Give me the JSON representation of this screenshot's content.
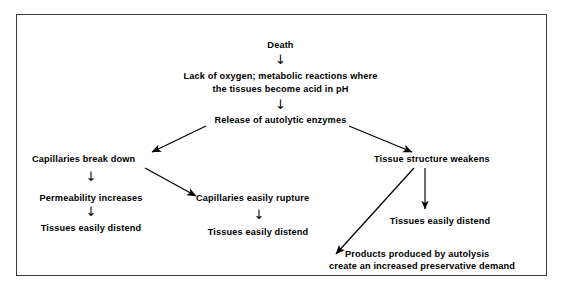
{
  "diagram": {
    "title_absent": true,
    "border_color": "#3a3a3a",
    "text_color": "#000000",
    "background": "#ffffff",
    "nodes": [
      {
        "id": "death",
        "label": "Death"
      },
      {
        "id": "lack_oxygen_l1",
        "label": "Lack of oxygen; metabolic reactions where"
      },
      {
        "id": "lack_oxygen_l2",
        "label": "the tissues become acid in pH"
      },
      {
        "id": "release_enzymes",
        "label": "Release of autolytic enzymes"
      },
      {
        "id": "capillaries_break",
        "label": "Capillaries break down"
      },
      {
        "id": "permeability",
        "label": "Permeability increases"
      },
      {
        "id": "tissues_distend_left",
        "label": "Tissues easily distend"
      },
      {
        "id": "capillaries_rupture",
        "label": "Capillaries easily rupture"
      },
      {
        "id": "tissues_distend_mid",
        "label": "Tissues easily distend"
      },
      {
        "id": "tissue_weakens",
        "label": "Tissue structure weakens"
      },
      {
        "id": "tissues_distend_right",
        "label": "Tissues easily distend"
      },
      {
        "id": "products_autolysis_l1",
        "label": "Products produced by autolysis"
      },
      {
        "id": "products_autolysis_l2",
        "label": "create an increased  preservative demand"
      }
    ],
    "arrows": [
      {
        "id": "death-to-lack",
        "kind": "down-glyph",
        "glyph": "↓"
      },
      {
        "id": "lack-to-release",
        "kind": "down-glyph",
        "glyph": "↓"
      },
      {
        "id": "release-to-capillaries",
        "kind": "diagonal-left"
      },
      {
        "id": "release-to-tissue-weakens",
        "kind": "diagonal-right"
      },
      {
        "id": "capillaries-to-permeability",
        "kind": "down-glyph",
        "glyph": "↓"
      },
      {
        "id": "permeability-to-distend",
        "kind": "down-glyph",
        "glyph": "↓"
      },
      {
        "id": "capillaries-to-rupture",
        "kind": "diagonal-right"
      },
      {
        "id": "rupture-to-distend",
        "kind": "down-glyph",
        "glyph": "↓"
      },
      {
        "id": "weakens-to-distend",
        "kind": "down-line"
      },
      {
        "id": "weakens-to-products",
        "kind": "diagonal-left"
      }
    ]
  }
}
